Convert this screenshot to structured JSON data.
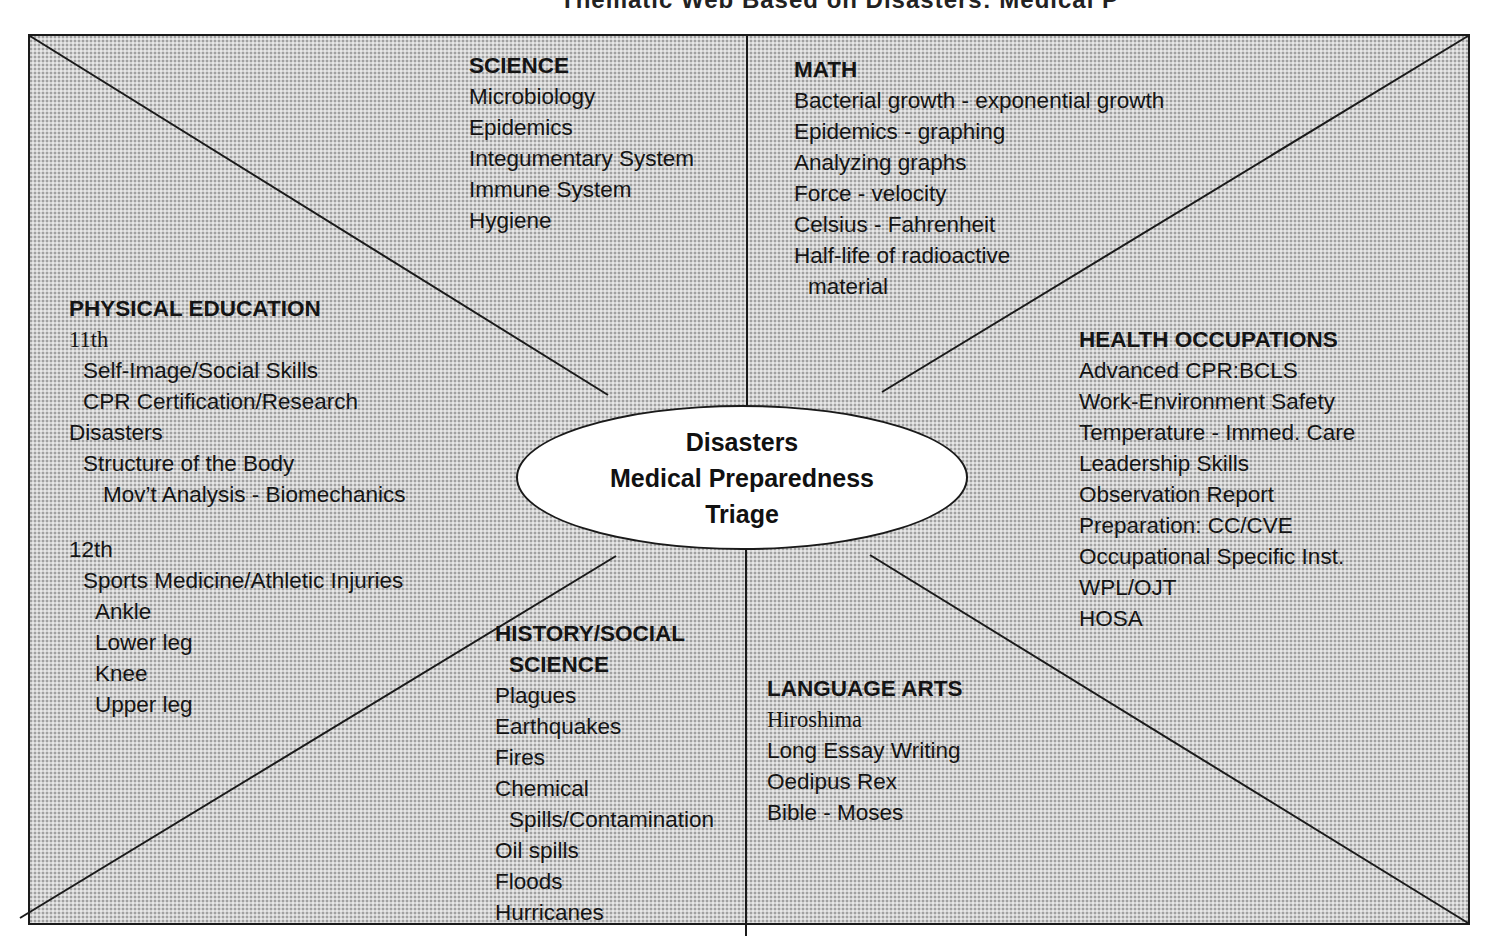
{
  "title": "Thematic Web Based on Disasters: Medical Preparedness and Triage",
  "hub": {
    "lines": [
      "Disasters",
      "Medical Preparedness",
      "Triage"
    ]
  },
  "sections": {
    "science": {
      "heading": "SCIENCE",
      "items": [
        "Microbiology",
        "Epidemics",
        "Integumentary System",
        "Immune System",
        "Hygiene"
      ]
    },
    "math": {
      "heading": "MATH",
      "items": [
        "Bacterial growth - exponential growth",
        "Epidemics - graphing",
        "Analyzing graphs",
        "Force - velocity",
        "Celsius - Fahrenheit",
        "Half-life of radioactive",
        "material"
      ]
    },
    "physical_education": {
      "heading": "PHYSICAL EDUCATION",
      "grade_11": "11th",
      "grade_11_items": [
        "Self-Image/Social Skills",
        "CPR Certification/Research"
      ],
      "disasters": "Disasters",
      "disasters_items": [
        "Structure of the Body"
      ],
      "disasters_subitems": [
        "Mov’t Analysis - Biomechanics"
      ],
      "grade_12": "12th",
      "grade_12_items": [
        "Sports Medicine/Athletic Injuries"
      ],
      "grade_12_subitems": [
        "Ankle",
        "Lower leg",
        "Knee",
        "Upper leg"
      ]
    },
    "health_occupations": {
      "heading": "HEALTH OCCUPATIONS",
      "items": [
        "Advanced CPR:BCLS",
        "Work-Environment Safety",
        "Temperature - Immed. Care",
        "Leadership Skills",
        "Observation Report",
        "Preparation: CC/CVE",
        "Occupational Specific Inst.",
        "WPL/OJT",
        "HOSA"
      ]
    },
    "history_social_science": {
      "heading_line1": "HISTORY/SOCIAL",
      "heading_line2": "SCIENCE",
      "items": [
        "Plagues",
        "Earthquakes",
        "Fires",
        "Chemical",
        "Spills/Contamination",
        "Oil spills",
        "Floods",
        "Hurricanes"
      ]
    },
    "language_arts": {
      "heading": "LANGUAGE ARTS",
      "items": [
        "Hiroshima",
        "Long Essay Writing",
        "Oedipus Rex",
        "Bible - Moses"
      ]
    }
  },
  "colors": {
    "background": "#ffffff",
    "panel_fill": "#d3d3d3",
    "line": "#1a1a1a",
    "hub_fill": "#ffffff",
    "text": "#141414"
  }
}
